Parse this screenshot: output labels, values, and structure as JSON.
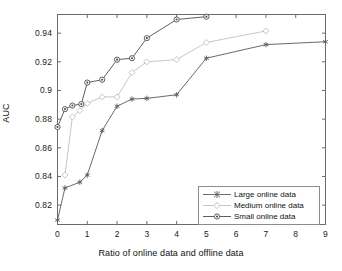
{
  "chart_data": {
    "type": "line",
    "title": "",
    "xlabel": "Ratio of online data and offline data",
    "ylabel": "AUC",
    "xlim": [
      0,
      9
    ],
    "ylim": [
      0.8065,
      0.953
    ],
    "xticks": [
      0,
      1,
      2,
      3,
      4,
      5,
      6,
      7,
      8,
      9
    ],
    "xtick_labels": [
      "0",
      "1",
      "2",
      "3",
      "4",
      "5",
      "6",
      "7",
      "8",
      "9"
    ],
    "yticks": [
      0.82,
      0.84,
      0.86,
      0.88,
      0.9,
      0.92,
      0.94
    ],
    "ytick_labels": [
      "0.82",
      "0.84",
      "0.86",
      "0.88",
      "0.9",
      "0.92",
      "0.94"
    ],
    "grid": false,
    "legend_position": "lower right",
    "series": [
      {
        "name": "Large online data",
        "marker": "asterisk",
        "color": "#595959",
        "x": [
          0,
          0.25,
          0.75,
          1.0,
          1.5,
          2.0,
          2.5,
          3.0,
          4.0,
          5.0,
          7.0,
          9.0
        ],
        "y": [
          0.8095,
          0.832,
          0.836,
          0.841,
          0.872,
          0.889,
          0.894,
          0.8945,
          0.897,
          0.9225,
          0.932,
          0.934
        ]
      },
      {
        "name": "Medium online data",
        "marker": "diamond",
        "color": "#bfbfbf",
        "x": [
          0.25,
          0.5,
          0.75,
          1.0,
          1.5,
          2.0,
          2.5,
          3.0,
          4.0,
          5.0,
          7.0
        ],
        "y": [
          0.841,
          0.8815,
          0.886,
          0.891,
          0.8955,
          0.8955,
          0.9125,
          0.92,
          0.9215,
          0.9335,
          0.9415
        ]
      },
      {
        "name": "Small online data",
        "marker": "circle",
        "color": "#4d4d4d",
        "x": [
          0,
          0.25,
          0.5,
          0.8,
          1.0,
          1.5,
          2.0,
          2.5,
          3.0,
          4.0,
          5.0
        ],
        "y": [
          0.8745,
          0.887,
          0.8895,
          0.8905,
          0.9055,
          0.9075,
          0.9215,
          0.9225,
          0.9365,
          0.9495,
          0.9515
        ]
      }
    ]
  },
  "axes": {
    "frame_color": "#6b6b6b"
  },
  "legend": {
    "items": [
      {
        "label": "Large online data"
      },
      {
        "label": "Medium online data"
      },
      {
        "label": "Small online data"
      }
    ]
  }
}
